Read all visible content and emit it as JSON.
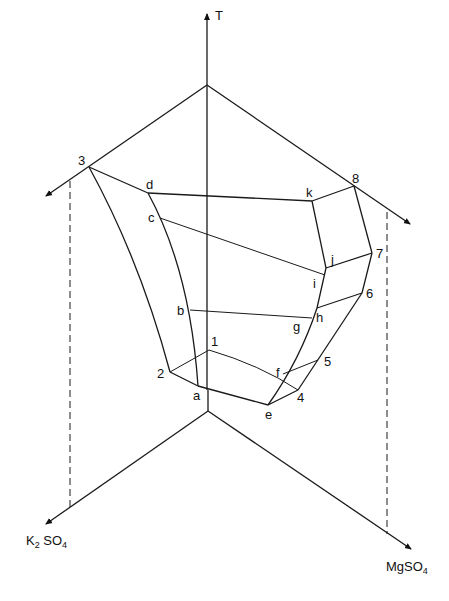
{
  "diagram": {
    "type": "ternary-phase-prism",
    "axes": {
      "vertical": {
        "label": "T"
      },
      "left": {
        "label_main": "K",
        "label_sub1": "2",
        "label_mid": " SO",
        "label_sub2": "4"
      },
      "right": {
        "label_main": "MgSO",
        "label_sub": "4"
      }
    },
    "points": {
      "p1": "1",
      "p2": "2",
      "p3": "3",
      "p4": "4",
      "p5": "5",
      "p6": "6",
      "p7": "7",
      "p8": "8",
      "a": "a",
      "b": "b",
      "c": "c",
      "d": "d",
      "e": "e",
      "f": "f",
      "g": "g",
      "h": "h",
      "i": "i",
      "j": "j",
      "k": "k"
    }
  }
}
